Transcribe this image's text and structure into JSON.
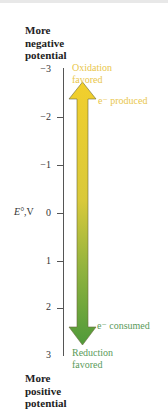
{
  "header": {
    "top_label": [
      "More",
      "negative",
      "potential"
    ],
    "bottom_label": [
      "More",
      "positive",
      "potential"
    ]
  },
  "axis": {
    "label_symbol": "E°",
    "label_unit": ",V",
    "ticks": [
      "−3",
      "−2",
      "−1",
      "0",
      "1",
      "2",
      "3"
    ]
  },
  "annotations": {
    "oxidation": [
      "Oxidation",
      "favored"
    ],
    "produced": "e⁻ produced",
    "consumed": "e⁻ consumed",
    "reduction": [
      "Reduction",
      "favored"
    ]
  },
  "colors": {
    "oxidation": "#e9c64b",
    "arrow_top": "#f2cf2c",
    "arrow_mid": "#c9c63a",
    "arrow_bottom": "#4f9a3a",
    "reduction": "#5a9a5a"
  }
}
